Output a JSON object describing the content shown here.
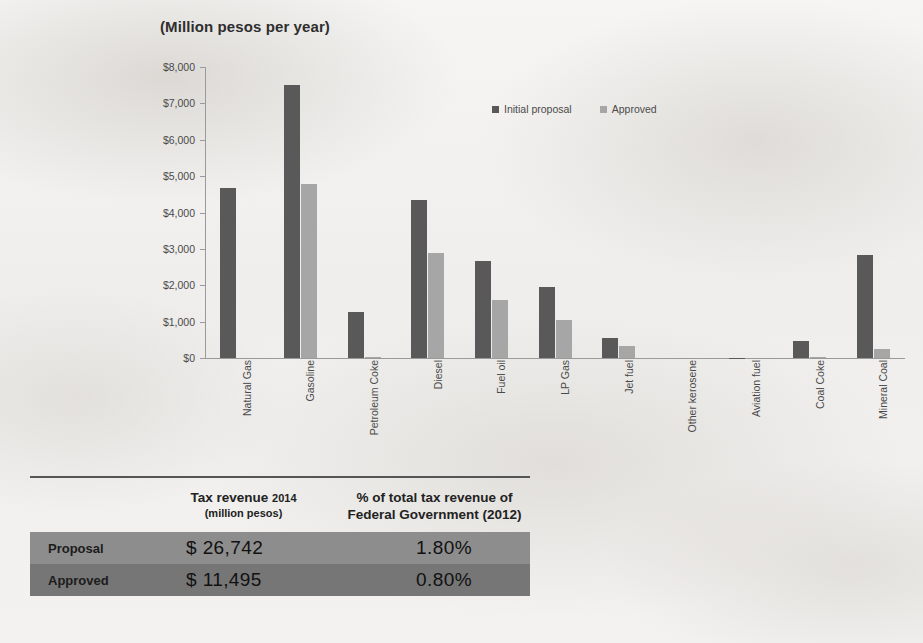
{
  "chart_data": {
    "type": "bar",
    "title": "(Million pesos per year)",
    "xlabel": "",
    "ylabel": "",
    "ylim": [
      0,
      8000
    ],
    "ytick_labels": [
      "$8,000",
      "$7,000",
      "$6,000",
      "$5,000",
      "$4,000",
      "$3,000",
      "$2,000",
      "$1,000",
      "$0"
    ],
    "ytick_values": [
      8000,
      7000,
      6000,
      5000,
      4000,
      3000,
      2000,
      1000,
      0
    ],
    "grid": false,
    "legend_position": "top-right",
    "categories": [
      "Natural Gas",
      "Gasoline",
      "Petroleum Coke",
      "Diesel",
      "Fuel oil",
      "LP Gas",
      "Jet fuel",
      "Other kerosene",
      "Aviation fuel",
      "Coal Coke",
      "Mineral Coal"
    ],
    "series": [
      {
        "name": "Initial proposal",
        "color": "#595959",
        "values": [
          4680,
          7500,
          1270,
          4350,
          2660,
          1950,
          550,
          0,
          10,
          470,
          2840
        ]
      },
      {
        "name": "Approved",
        "color": "#a6a6a6",
        "values": [
          0,
          4780,
          40,
          2890,
          1600,
          1040,
          330,
          0,
          0,
          30,
          260
        ]
      }
    ]
  },
  "table": {
    "columns": [
      {
        "main": "Tax revenue",
        "year": "2014",
        "sub": "(million pesos)"
      },
      {
        "line1": "% of total tax revenue of",
        "line2": "Federal Government (2012)"
      }
    ],
    "rows": [
      {
        "label": "Proposal",
        "revenue": "$ 26,742",
        "percent": "1.80%"
      },
      {
        "label": "Approved",
        "revenue": "$ 11,495",
        "percent": "0.80%"
      }
    ]
  },
  "colors": {
    "proposal": "#595959",
    "approved": "#a6a6a6",
    "row1_bg": "#8d8d8d",
    "row2_bg": "#767676",
    "axis": "#9a9a9a"
  }
}
